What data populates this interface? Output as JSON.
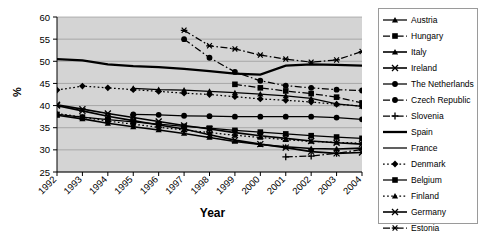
{
  "chart_data": {
    "type": "line",
    "title": "",
    "xlabel": "Year",
    "ylabel": "%",
    "x": [
      1992,
      1993,
      1994,
      1995,
      1996,
      1997,
      1998,
      1999,
      2000,
      2001,
      2002,
      2003,
      2004
    ],
    "xlim": [
      1992,
      2004
    ],
    "ylim": [
      25,
      60
    ],
    "yticks": [
      25,
      30,
      35,
      40,
      45,
      50,
      55,
      60
    ],
    "xticks": [
      "1992",
      "1993",
      "1994",
      "1995",
      "1996",
      "1997",
      "1998",
      "1999",
      "2000",
      "2001",
      "2002",
      "2003",
      "2004"
    ],
    "grid": "horizontal",
    "legend_position": "right",
    "plot_background": "#d4d4d4",
    "series": [
      {
        "name": "Austria",
        "marker": "triangle",
        "dash": "solid",
        "values": [
          null,
          null,
          null,
          43.9,
          43.6,
          43.5,
          43.2,
          42.9,
          42.6,
          42.2,
          41.6,
          40.4,
          39.8
        ]
      },
      {
        "name": "Hungary",
        "marker": "square",
        "dash": "dashdot",
        "values": [
          null,
          null,
          null,
          null,
          null,
          null,
          null,
          44.8,
          44.0,
          43.3,
          42.7,
          41.9,
          40.6
        ]
      },
      {
        "name": "Italy",
        "marker": "triangle",
        "dash": "solid",
        "values": [
          37.8,
          37.0,
          36.0,
          35.2,
          34.5,
          33.7,
          32.8,
          31.9,
          31.2,
          30.7,
          30.3,
          30.2,
          30.4
        ]
      },
      {
        "name": "Ireland",
        "marker": "x",
        "dash": "solid",
        "values": [
          40.0,
          38.8,
          37.6,
          36.6,
          35.6,
          34.7,
          33.4,
          32.2,
          31.3,
          30.5,
          29.6,
          29.2,
          29.4
        ]
      },
      {
        "name": "The Netherlands",
        "marker": "circle",
        "dash": "solid",
        "values": [
          null,
          null,
          null,
          38.0,
          37.9,
          37.7,
          37.6,
          37.5,
          37.5,
          37.5,
          37.5,
          37.3,
          36.9
        ]
      },
      {
        "name": "Czech Republic",
        "marker": "circle",
        "dash": "dashdot",
        "values": [
          null,
          null,
          null,
          null,
          null,
          55.0,
          50.8,
          47.6,
          45.6,
          44.5,
          44.0,
          43.6,
          43.4
        ]
      },
      {
        "name": "Slovenia",
        "marker": "plus",
        "dash": "dashdot",
        "values": [
          null,
          null,
          null,
          null,
          null,
          null,
          null,
          null,
          null,
          28.4,
          28.6,
          29.2,
          30.1
        ]
      },
      {
        "name": "Spain",
        "marker": "none",
        "dash": "solid",
        "values": [
          50.5,
          50.2,
          49.3,
          48.9,
          48.7,
          48.3,
          47.8,
          47.2,
          47.0,
          49.0,
          49.3,
          49.2,
          49.0
        ]
      },
      {
        "name": "France",
        "marker": "none",
        "dash": "solid",
        "values": [
          null,
          null,
          null,
          null,
          null,
          null,
          null,
          null,
          null,
          null,
          null,
          null,
          null
        ]
      },
      {
        "name": "Denmark",
        "marker": "diamond",
        "dash": "dotted",
        "values": [
          43.5,
          44.4,
          44.0,
          43.6,
          43.2,
          42.8,
          42.5,
          42.0,
          41.5,
          41.2,
          40.8,
          40.3,
          39.9
        ]
      },
      {
        "name": "Belgium",
        "marker": "square",
        "dash": "solid",
        "values": [
          38.0,
          37.4,
          36.8,
          36.3,
          35.8,
          35.3,
          34.9,
          34.4,
          34.0,
          33.6,
          33.2,
          32.9,
          32.6
        ]
      },
      {
        "name": "Finland",
        "marker": "triangle",
        "dash": "dotted",
        "values": [
          38.2,
          37.4,
          36.5,
          35.8,
          35.1,
          34.5,
          33.9,
          33.3,
          32.8,
          32.3,
          31.9,
          31.7,
          31.5
        ]
      },
      {
        "name": "Germany",
        "marker": "x",
        "dash": "solid",
        "values": [
          40.2,
          39.2,
          38.2,
          37.3,
          36.4,
          35.5,
          34.7,
          33.9,
          33.2,
          32.6,
          32.0,
          31.6,
          31.3
        ]
      },
      {
        "name": "Estonia",
        "marker": "asterisk",
        "dash": "dashdot",
        "values": [
          null,
          null,
          null,
          null,
          null,
          57.0,
          53.5,
          52.8,
          51.4,
          50.5,
          49.8,
          50.3,
          52.2
        ]
      }
    ]
  },
  "legend": {
    "items": [
      {
        "label": "Austria"
      },
      {
        "label": "Hungary"
      },
      {
        "label": "Italy"
      },
      {
        "label": "Ireland"
      },
      {
        "label": "The Netherlands"
      },
      {
        "label": "Czech Republic"
      },
      {
        "label": "Slovenia"
      },
      {
        "label": "Spain"
      },
      {
        "label": "France"
      },
      {
        "label": "Denmark"
      },
      {
        "label": "Belgium"
      },
      {
        "label": "Finland"
      },
      {
        "label": "Germany"
      },
      {
        "label": "Estonia"
      }
    ]
  }
}
